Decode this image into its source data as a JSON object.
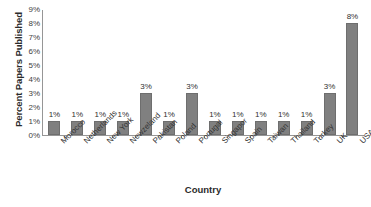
{
  "chart_data": {
    "type": "bar",
    "title": "",
    "xlabel": "Country",
    "ylabel": "Percent Papers Published",
    "categories": [
      "Morocco",
      "Netherlands",
      "New York",
      "Newzeland",
      "Pakistan",
      "Poland",
      "Portugal",
      "Singapor",
      "Spain",
      "Taiwan",
      "Thailand",
      "Turkey",
      "UK",
      "USA"
    ],
    "values": [
      1,
      1,
      1,
      1,
      3,
      1,
      3,
      1,
      1,
      1,
      1,
      1,
      3,
      8
    ],
    "data_labels": [
      "1%",
      "1%",
      "1%",
      "1%",
      "3%",
      "1%",
      "3%",
      "1%",
      "1%",
      "1%",
      "1%",
      "1%",
      "3%",
      "8%"
    ],
    "ylim": [
      0,
      9
    ],
    "ytick_values": [
      0,
      1,
      2,
      3,
      4,
      5,
      6,
      7,
      8,
      9
    ],
    "ytick_labels": [
      "0%",
      "1%",
      "2%",
      "3%",
      "4%",
      "5%",
      "6%",
      "7%",
      "8%",
      "9%"
    ],
    "grid": false,
    "legend": false,
    "legend_position": "none",
    "bar_color": "#808080",
    "bar_border_color": "#6e6e6e",
    "axis_color": "#969696",
    "text_color": "#303030",
    "background_color": "#ffffff",
    "x_label_rotation": -45
  }
}
